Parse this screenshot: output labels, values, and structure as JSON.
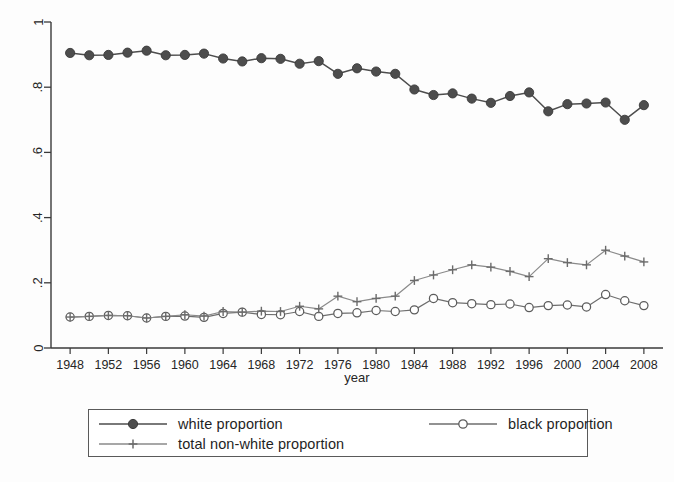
{
  "chart_data": {
    "type": "line",
    "title": "",
    "subtitle": "",
    "xlabel": "year",
    "ylabel": "",
    "xlim": [
      1946,
      2010
    ],
    "ylim": [
      0,
      1
    ],
    "xticks": [
      1948,
      1952,
      1956,
      1960,
      1964,
      1968,
      1972,
      1976,
      1980,
      1984,
      1988,
      1992,
      1996,
      2000,
      2004,
      2008
    ],
    "yticks": [
      "0",
      ".2",
      ".4",
      ".6",
      ".8",
      "1"
    ],
    "ytick_values": [
      0,
      0.2,
      0.4,
      0.6,
      0.8,
      1
    ],
    "grid": false,
    "legend_position": "bottom",
    "x": [
      1948,
      1950,
      1952,
      1954,
      1956,
      1958,
      1960,
      1962,
      1964,
      1966,
      1968,
      1970,
      1972,
      1974,
      1976,
      1978,
      1980,
      1982,
      1984,
      1986,
      1988,
      1990,
      1992,
      1994,
      1996,
      1998,
      2000,
      2002,
      2004,
      2006,
      2008
    ],
    "series": [
      {
        "name": "white proportion",
        "marker": "filled-circle",
        "color": "#4d4d4d",
        "values": [
          0.905,
          0.898,
          0.899,
          0.906,
          0.912,
          0.898,
          0.899,
          0.903,
          0.888,
          0.879,
          0.889,
          0.887,
          0.872,
          0.88,
          0.841,
          0.858,
          0.848,
          0.841,
          0.793,
          0.776,
          0.781,
          0.765,
          0.752,
          0.773,
          0.784,
          0.726,
          0.748,
          0.75,
          0.753,
          0.7,
          0.745
        ]
      },
      {
        "name": "black proportion",
        "marker": "open-circle",
        "color": "#6e6e6e",
        "values": [
          0.095,
          0.097,
          0.1,
          0.099,
          0.092,
          0.097,
          0.098,
          0.094,
          0.106,
          0.11,
          0.103,
          0.102,
          0.112,
          0.097,
          0.106,
          0.108,
          0.115,
          0.112,
          0.117,
          0.152,
          0.139,
          0.136,
          0.133,
          0.135,
          0.124,
          0.13,
          0.132,
          0.126,
          0.164,
          0.145,
          0.13
        ]
      },
      {
        "name": "total non-white proportion",
        "marker": "plus",
        "color": "#8a8a8a",
        "values": [
          0.095,
          0.097,
          0.1,
          0.099,
          0.092,
          0.097,
          0.102,
          0.098,
          0.112,
          0.11,
          0.113,
          0.112,
          0.128,
          0.12,
          0.159,
          0.142,
          0.152,
          0.159,
          0.207,
          0.224,
          0.24,
          0.255,
          0.248,
          0.235,
          0.219,
          0.274,
          0.262,
          0.255,
          0.3,
          0.282,
          0.264
        ]
      }
    ]
  },
  "axis": {
    "x_title": "year",
    "ytick_0": "0",
    "ytick_1": ".2",
    "ytick_2": ".4",
    "ytick_3": ".6",
    "ytick_4": ".8",
    "ytick_5": "1"
  },
  "legend": {
    "entries": [
      {
        "label": "white proportion",
        "marker": "filled-circle"
      },
      {
        "label": "black proportion",
        "marker": "open-circle"
      },
      {
        "label": "total non-white proportion",
        "marker": "plus"
      }
    ]
  }
}
